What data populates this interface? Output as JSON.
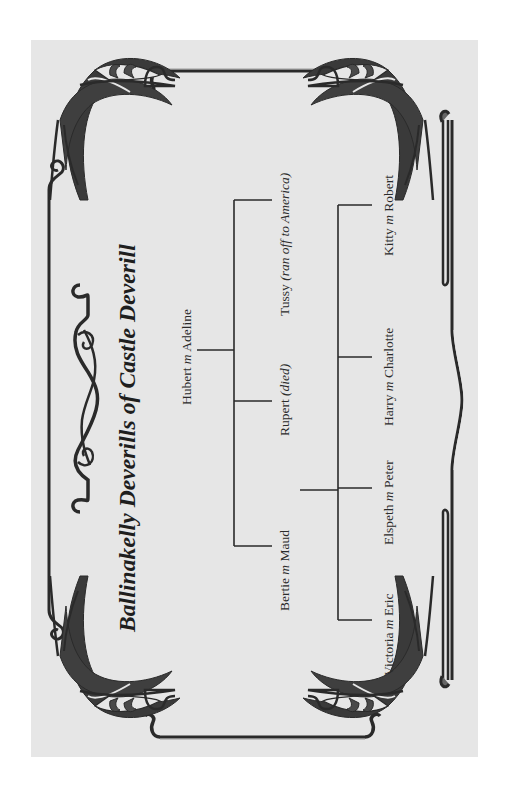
{
  "title": "Ballinakelly Deverills of Castle Deverill",
  "colors": {
    "panel_background": "#e6e6e6",
    "page_background": "#ffffff",
    "ink": "#2a2a2a"
  },
  "tree": {
    "root": {
      "name": "Hubert",
      "marriage_marker": "m",
      "spouse": "Adeline"
    },
    "children": [
      {
        "name": "Bertie",
        "marriage_marker": "m",
        "spouse": "Maud",
        "note": ""
      },
      {
        "name": "Rupert",
        "marriage_marker": "",
        "spouse": "",
        "note": "(died)"
      },
      {
        "name": "Tussy",
        "marriage_marker": "",
        "spouse": "",
        "note": "(ran off to America)"
      }
    ],
    "grandchildren": [
      {
        "name": "Victoria",
        "marriage_marker": "m",
        "spouse": "Eric"
      },
      {
        "name": "Elspeth",
        "marriage_marker": "m",
        "spouse": "Peter"
      },
      {
        "name": "Harry",
        "marriage_marker": "m",
        "spouse": "Charlotte"
      },
      {
        "name": "Kitty",
        "marriage_marker": "m",
        "spouse": "Robert"
      }
    ]
  },
  "ornaments": {
    "corners": [
      "art-nouveau-corner-top-left",
      "art-nouveau-corner-top-right",
      "art-nouveau-corner-bottom-left",
      "art-nouveau-corner-bottom-right"
    ],
    "side_flourish": "art-nouveau-scroll-flourish"
  }
}
